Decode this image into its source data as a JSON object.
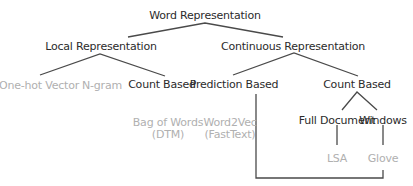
{
  "tree": {
    "root": "Word Representation",
    "local": {
      "label": "Local Representation",
      "children": [
        "One-hot Vector",
        "N-gram",
        "Count Based"
      ],
      "count_based_examples": [
        "Bag of Words",
        "(DTM)"
      ]
    },
    "continuous": {
      "label": "Continuous Representation",
      "prediction": {
        "label": "Prediction Based",
        "examples": [
          "Word2Vec",
          "(FastText)"
        ]
      },
      "count": {
        "label": "Count Based",
        "full_document": {
          "label": "Full Document",
          "example": "LSA"
        },
        "windows": {
          "label": "Windows",
          "example": "Glove"
        }
      }
    }
  },
  "colors": {
    "primary_text": "#2b2b2b",
    "secondary_text": "#b0b0b0",
    "line": "#4a4a4a"
  }
}
